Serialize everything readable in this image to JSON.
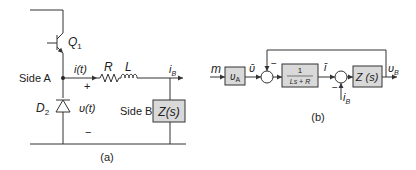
{
  "circuit_a": {
    "caption": "(a)",
    "transistor_label": "Q",
    "transistor_sub": "1",
    "diode_label": "D",
    "diode_sub": "2",
    "side_a_label": "Side A",
    "side_b_label": "Side B",
    "current_label": "i(t)",
    "voltage_label": "υ(t)",
    "plus_sign": "+",
    "minus_sign": "−",
    "resistor_label": "R",
    "inductor_label": "L",
    "load_current_label": "i",
    "load_current_sub": "B",
    "impedance_label": "Z(s)"
  },
  "block_b": {
    "caption": "(b)",
    "input_label": "m",
    "gain_block": "υ",
    "gain_block_sub": "A",
    "avg_voltage_label": "ῡ",
    "feedback_sign": "−",
    "transfer_numerator": "1",
    "transfer_denominator": "Ls + R",
    "avg_current_label": "ī",
    "disturbance_sign": "−",
    "disturbance_label": "i",
    "disturbance_sub": "B",
    "impedance_block": "Z (s)",
    "output_label": "υ",
    "output_sub": "B"
  }
}
